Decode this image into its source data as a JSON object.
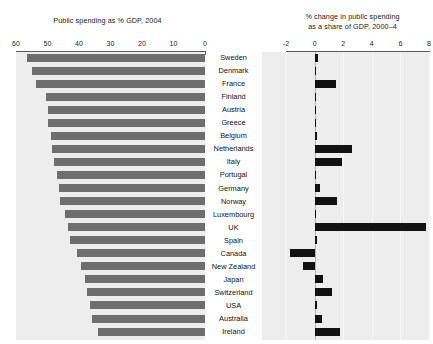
{
  "chart_data": {
    "type": "bar",
    "panels": [
      {
        "id": "public-spending-share",
        "title": "Public spending as % GDP, 2004",
        "orientation": "horizontal",
        "direction": "right-to-left",
        "xlabel": "",
        "ylabel": "",
        "xlim": [
          60,
          0
        ],
        "ticks": [
          60,
          50,
          40,
          30,
          20,
          10,
          0
        ],
        "grid": false,
        "bar_color": "#6e6e6e",
        "categories": [
          "Sweden",
          "Denmark",
          "France",
          "Finland",
          "Austria",
          "Greece",
          "Belgium",
          "Netherlands",
          "Italy",
          "Portugal",
          "Germany",
          "Norway",
          "Luxembourg",
          "UK",
          "Spain",
          "Canada",
          "New Zealand",
          "Japan",
          "Switzerland",
          "USA",
          "Australia",
          "Ireland"
        ],
        "values": [
          56.5,
          55.0,
          53.5,
          50.5,
          50.0,
          50.0,
          49.0,
          48.5,
          48.0,
          47.0,
          46.5,
          46.0,
          44.5,
          43.5,
          43.0,
          40.5,
          39.5,
          38.0,
          37.5,
          36.5,
          36.0,
          34.0
        ]
      },
      {
        "id": "change-in-public-spending",
        "title": "% change in public spending\nas a share of GDP, 2000–4",
        "orientation": "horizontal",
        "direction": "left-to-right",
        "xlabel": "",
        "ylabel": "",
        "xlim": [
          -2,
          8
        ],
        "ticks": [
          -2,
          0,
          2,
          4,
          6,
          8
        ],
        "grid": true,
        "bar_color": "#111111",
        "zero_line": 0,
        "categories": [
          "Sweden",
          "Denmark",
          "France",
          "Finland",
          "Austria",
          "Greece",
          "Belgium",
          "Netherlands",
          "Italy",
          "Portugal",
          "Germany",
          "Norway",
          "Luxembourg",
          "UK",
          "Spain",
          "Canada",
          "New Zealand",
          "Japan",
          "Switzerland",
          "USA",
          "Australia",
          "Ireland"
        ],
        "values": [
          0.25,
          0.0,
          1.5,
          0.0,
          0.0,
          0.0,
          0.15,
          2.6,
          1.9,
          0.0,
          0.4,
          1.6,
          0.1,
          7.8,
          0.15,
          -1.7,
          -0.8,
          0.6,
          1.2,
          0.2,
          0.5,
          1.8
        ]
      }
    ]
  },
  "axis_left": {
    "tick_labels": [
      "60",
      "50",
      "40",
      "30",
      "20",
      "10",
      "0"
    ]
  },
  "axis_right": {
    "tick_labels": [
      "-2",
      "0",
      "2",
      "4",
      "6",
      "8"
    ]
  }
}
